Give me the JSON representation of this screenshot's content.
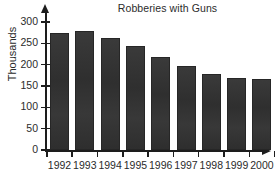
{
  "chart_data": {
    "type": "bar",
    "title": "Robberies with Guns",
    "xlabel": "",
    "ylabel": "Thousands",
    "categories": [
      "1992",
      "1993",
      "1994",
      "1995",
      "1996",
      "1997",
      "1998",
      "1999",
      "2000"
    ],
    "values": [
      274,
      279,
      262,
      244,
      219,
      197,
      177,
      169,
      166
    ],
    "ylim": [
      0,
      300
    ],
    "yticks": [
      0,
      50,
      100,
      150,
      200,
      250,
      300
    ],
    "ytick_labels": [
      "0",
      "50",
      "100",
      "150",
      "200",
      "250",
      "300"
    ],
    "grid": false,
    "legend": null,
    "bar_color": "#343434",
    "axis_color": "#1d1d1d",
    "text_color": "#2b2b2b",
    "background_color": "#ffffff"
  }
}
